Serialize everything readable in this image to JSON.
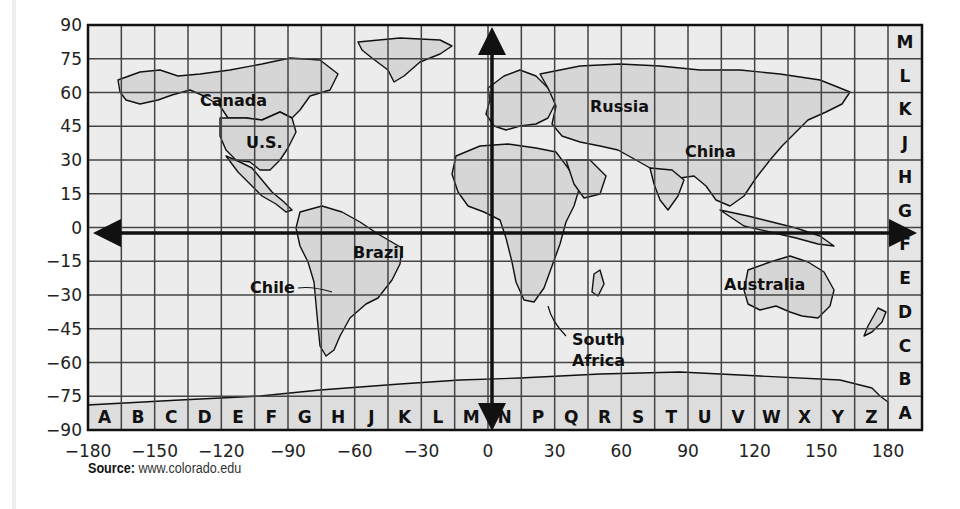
{
  "map": {
    "type": "world-grid-map",
    "latitude_labels": [
      "90",
      "75",
      "60",
      "45",
      "30",
      "15",
      "0",
      "−15",
      "−30",
      "−45",
      "−60",
      "−75",
      "−90"
    ],
    "longitude_labels": [
      "−180",
      "−150",
      "−120",
      "−90",
      "−60",
      "−30",
      "0",
      "30",
      "60",
      "90",
      "120",
      "150",
      "180"
    ],
    "column_letters": [
      "A",
      "B",
      "C",
      "D",
      "E",
      "F",
      "G",
      "H",
      "J",
      "K",
      "L",
      "M",
      "N",
      "P",
      "Q",
      "R",
      "S",
      "T",
      "U",
      "V",
      "W",
      "X",
      "Y",
      "Z"
    ],
    "row_letters_top_to_bottom": [
      "M",
      "L",
      "K",
      "J",
      "H",
      "G",
      "F",
      "E",
      "D",
      "C",
      "B",
      "A"
    ],
    "countries": [
      {
        "name": "Canada",
        "x": 200,
        "y": 106
      },
      {
        "name": "U.S.",
        "x": 246,
        "y": 148
      },
      {
        "name": "Russia",
        "x": 590,
        "y": 112
      },
      {
        "name": "China",
        "x": 685,
        "y": 157
      },
      {
        "name": "Brazil",
        "x": 353,
        "y": 258
      },
      {
        "name": "Chile",
        "x": 250,
        "y": 293
      },
      {
        "name": "Australia",
        "x": 724,
        "y": 290
      },
      {
        "name": "South",
        "x": 572,
        "y": 345
      },
      {
        "name": "Africa",
        "x": 572,
        "y": 366
      }
    ],
    "colors": {
      "ocean": "#ececec",
      "land": "#d6d6d6",
      "grid": "#333333",
      "border": "#111111",
      "axis": "#111111"
    }
  },
  "source": {
    "label": "Source:",
    "text": "www.colorado.edu"
  }
}
